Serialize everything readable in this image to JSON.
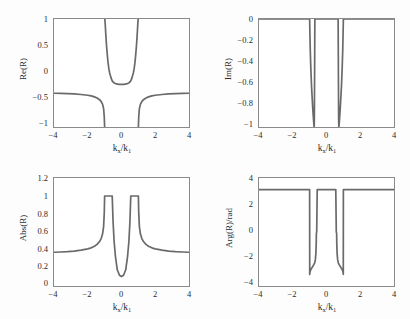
{
  "figure": {
    "background": "#fdfdfd",
    "line_color": "#6a6a6a",
    "axis_color": "#8a8a8a",
    "text_color": "#2b2b2b"
  },
  "chart_data": [
    {
      "type": "line",
      "id": "re-r",
      "title": "",
      "xlabel": "k_x/k_1",
      "ylabel": "Re(R)",
      "xlim": [
        -4,
        4
      ],
      "ylim": [
        -1,
        1
      ],
      "xticks": [
        -4,
        -2,
        0,
        2,
        4
      ],
      "xticklabels": [
        "-4",
        "-2",
        "0",
        "2",
        "4"
      ],
      "yticks": [
        -1,
        -0.5,
        0,
        0.5,
        1
      ],
      "yticklabels": [
        "-1",
        "-0.5",
        "0",
        "0.5",
        "1"
      ],
      "grid": false,
      "legend": null,
      "series": [
        {
          "name": "Re(R)",
          "x": [
            -4.0,
            -3.6,
            -3.2,
            -2.8,
            -2.4,
            -2.0,
            -1.8,
            -1.6,
            -1.45,
            -1.3,
            -1.2,
            -1.12,
            -1.06,
            -1.02,
            -1.0,
            -0.99,
            -0.97,
            -0.95,
            -0.92,
            -0.88,
            -0.84,
            -0.8,
            -0.75,
            -0.7,
            -0.62,
            -0.55,
            -0.45,
            -0.3,
            -0.15,
            0.0,
            0.15,
            0.3,
            0.45,
            0.55,
            0.62,
            0.7,
            0.75,
            0.8,
            0.84,
            0.88,
            0.92,
            0.95,
            0.97,
            0.99,
            1.0,
            1.02,
            1.06,
            1.12,
            1.2,
            1.3,
            1.45,
            1.6,
            1.8,
            2.0,
            2.4,
            2.8,
            3.2,
            3.6,
            4.0
          ],
          "y": [
            -0.375,
            -0.378,
            -0.382,
            -0.388,
            -0.398,
            -0.412,
            -0.424,
            -0.442,
            -0.462,
            -0.494,
            -0.53,
            -0.58,
            -0.66,
            -0.82,
            -1.0,
            1.0,
            0.93,
            0.82,
            0.66,
            0.48,
            0.33,
            0.2,
            0.08,
            0.0,
            -0.09,
            -0.145,
            -0.182,
            -0.203,
            -0.21,
            -0.212,
            -0.21,
            -0.203,
            -0.182,
            -0.145,
            -0.09,
            0.0,
            0.08,
            0.2,
            0.33,
            0.48,
            0.66,
            0.82,
            0.93,
            1.0,
            -1.0,
            -0.82,
            -0.66,
            -0.58,
            -0.53,
            -0.494,
            -0.462,
            -0.442,
            -0.424,
            -0.412,
            -0.398,
            -0.388,
            -0.382,
            -0.378,
            -0.375
          ]
        }
      ]
    },
    {
      "type": "line",
      "id": "im-r",
      "title": "",
      "xlabel": "k_x/k_1",
      "ylabel": "Im(R)",
      "xlim": [
        -4,
        4
      ],
      "ylim": [
        -1,
        0
      ],
      "xticks": [
        -4,
        -2,
        0,
        2,
        4
      ],
      "xticklabels": [
        "-4",
        "-2",
        "0",
        "2",
        "4"
      ],
      "yticks": [
        -1,
        -0.8,
        -0.6,
        -0.4,
        -0.2,
        0
      ],
      "yticklabels": [
        "-1",
        "-0.8",
        "-0.6",
        "-0.4",
        "-0.2",
        "0"
      ],
      "grid": false,
      "legend": null,
      "series": [
        {
          "name": "Im(R)",
          "x": [
            -4.0,
            -3.0,
            -2.0,
            -1.3,
            -1.1,
            -1.02,
            -1.0,
            -0.985,
            -0.96,
            -0.93,
            -0.89,
            -0.85,
            -0.81,
            -0.78,
            -0.755,
            -0.74,
            -0.73,
            -0.72,
            -0.71,
            -0.7,
            -0.69,
            -0.6,
            -0.4,
            -0.2,
            0.0,
            0.2,
            0.4,
            0.6,
            0.69,
            0.7,
            0.71,
            0.72,
            0.73,
            0.74,
            0.755,
            0.78,
            0.81,
            0.85,
            0.89,
            0.93,
            0.96,
            0.985,
            1.0,
            1.02,
            1.1,
            1.3,
            2.0,
            3.0,
            4.0
          ],
          "y": [
            0.0,
            0.0,
            0.0,
            0.0,
            0.0,
            0.0,
            0.0,
            -0.12,
            -0.3,
            -0.45,
            -0.61,
            -0.73,
            -0.84,
            -0.91,
            -0.965,
            -0.99,
            -1.0,
            -0.93,
            -0.66,
            -0.33,
            0.0,
            0.0,
            0.0,
            0.0,
            0.0,
            0.0,
            0.0,
            0.0,
            0.0,
            -0.33,
            -0.66,
            -0.93,
            -1.0,
            -0.99,
            -0.965,
            -0.91,
            -0.84,
            -0.73,
            -0.61,
            -0.45,
            -0.3,
            -0.12,
            0.0,
            0.0,
            0.0,
            0.0,
            0.0,
            0.0,
            0.0
          ]
        }
      ]
    },
    {
      "type": "line",
      "id": "abs-r",
      "title": "",
      "xlabel": "k_x/k_1",
      "ylabel": "Abs(R)",
      "xlim": [
        -4,
        4
      ],
      "ylim": [
        0,
        1.2
      ],
      "xticks": [
        -4,
        -2,
        0,
        2,
        4
      ],
      "xticklabels": [
        "-4",
        "-2",
        "0",
        "2",
        "4"
      ],
      "yticks": [
        0,
        0.2,
        0.4,
        0.6,
        0.8,
        1,
        1.2
      ],
      "yticklabels": [
        "0",
        "0.2",
        "0.4",
        "0.6",
        "0.8",
        "1",
        "1.2"
      ],
      "grid": false,
      "legend": null,
      "series": [
        {
          "name": "Abs(R)",
          "x": [
            -4.0,
            -3.6,
            -3.2,
            -2.8,
            -2.4,
            -2.0,
            -1.8,
            -1.6,
            -1.45,
            -1.3,
            -1.2,
            -1.12,
            -1.06,
            -1.02,
            -1.0,
            -0.97,
            -0.93,
            -0.88,
            -0.84,
            -0.8,
            -0.78,
            -0.76,
            -0.75,
            -0.73,
            -0.7,
            -0.67,
            -0.64,
            -0.6,
            -0.58,
            -0.56,
            -0.55,
            -0.5,
            -0.44,
            -0.36,
            -0.25,
            -0.12,
            0.0,
            0.12,
            0.25,
            0.36,
            0.44,
            0.5,
            0.55,
            0.56,
            0.58,
            0.6,
            0.64,
            0.67,
            0.7,
            0.73,
            0.75,
            0.76,
            0.78,
            0.8,
            0.84,
            0.88,
            0.93,
            0.97,
            1.0,
            1.02,
            1.06,
            1.12,
            1.2,
            1.3,
            1.45,
            1.6,
            1.8,
            2.0,
            2.4,
            2.8,
            3.2,
            3.6,
            4.0
          ],
          "y": [
            0.375,
            0.378,
            0.382,
            0.388,
            0.398,
            0.412,
            0.424,
            0.442,
            0.462,
            0.494,
            0.53,
            0.58,
            0.66,
            0.82,
            1.0,
            1.0,
            1.0,
            1.0,
            1.0,
            1.0,
            1.0,
            1.0,
            1.0,
            1.0,
            1.0,
            1.0,
            1.0,
            1.0,
            1.0,
            1.0,
            1.0,
            0.72,
            0.5,
            0.33,
            0.18,
            0.12,
            0.105,
            0.12,
            0.18,
            0.33,
            0.5,
            0.72,
            1.0,
            1.0,
            1.0,
            1.0,
            1.0,
            1.0,
            1.0,
            1.0,
            1.0,
            1.0,
            1.0,
            1.0,
            1.0,
            1.0,
            1.0,
            1.0,
            1.0,
            0.82,
            0.66,
            0.58,
            0.53,
            0.494,
            0.462,
            0.442,
            0.424,
            0.412,
            0.398,
            0.388,
            0.382,
            0.378,
            0.375
          ]
        }
      ]
    },
    {
      "type": "line",
      "id": "arg-r",
      "title": "",
      "xlabel": "k_x/k_1",
      "ylabel": "Arg(R)/rad",
      "xlim": [
        -4,
        4
      ],
      "ylim": [
        -4,
        4
      ],
      "xticks": [
        -4,
        -2,
        0,
        2,
        4
      ],
      "xticklabels": [
        "-4",
        "-2",
        "0",
        "2",
        "4"
      ],
      "yticks": [
        -4,
        -2,
        0,
        2,
        4
      ],
      "yticklabels": [
        "-4",
        "-2",
        "0",
        "2",
        "4"
      ],
      "grid": false,
      "legend": null,
      "series": [
        {
          "name": "Arg(R)",
          "x": [
            -4.0,
            -3.0,
            -2.0,
            -1.4,
            -1.1,
            -1.02,
            -1.0,
            -0.995,
            -0.99,
            -0.97,
            -0.94,
            -0.9,
            -0.85,
            -0.8,
            -0.75,
            -0.7,
            -0.66,
            -0.63,
            -0.61,
            -0.6,
            -0.58,
            -0.55,
            -0.45,
            -0.3,
            -0.15,
            0.0,
            0.15,
            0.3,
            0.45,
            0.55,
            0.58,
            0.6,
            0.61,
            0.63,
            0.66,
            0.7,
            0.75,
            0.8,
            0.85,
            0.9,
            0.94,
            0.97,
            0.99,
            0.995,
            1.0,
            1.02,
            1.1,
            1.4,
            2.0,
            3.0,
            4.0
          ],
          "y": [
            3.1416,
            3.1416,
            3.1416,
            3.1416,
            3.1416,
            3.1416,
            3.1416,
            -3.1416,
            -3.05,
            -2.92,
            -2.82,
            -2.72,
            -2.62,
            -2.52,
            -2.42,
            -2.28,
            -2.05,
            -1.6,
            -0.9,
            -0.1,
            0.0,
            3.1416,
            3.1416,
            3.1416,
            3.1416,
            3.1416,
            3.1416,
            3.1416,
            3.1416,
            3.1416,
            0.0,
            -0.1,
            -0.9,
            -1.6,
            -2.05,
            -2.28,
            -2.42,
            -2.52,
            -2.62,
            -2.72,
            -2.82,
            -2.92,
            -3.05,
            -3.1416,
            3.1416,
            3.1416,
            3.1416,
            3.1416,
            3.1416,
            3.1416,
            3.1416
          ]
        }
      ]
    }
  ]
}
